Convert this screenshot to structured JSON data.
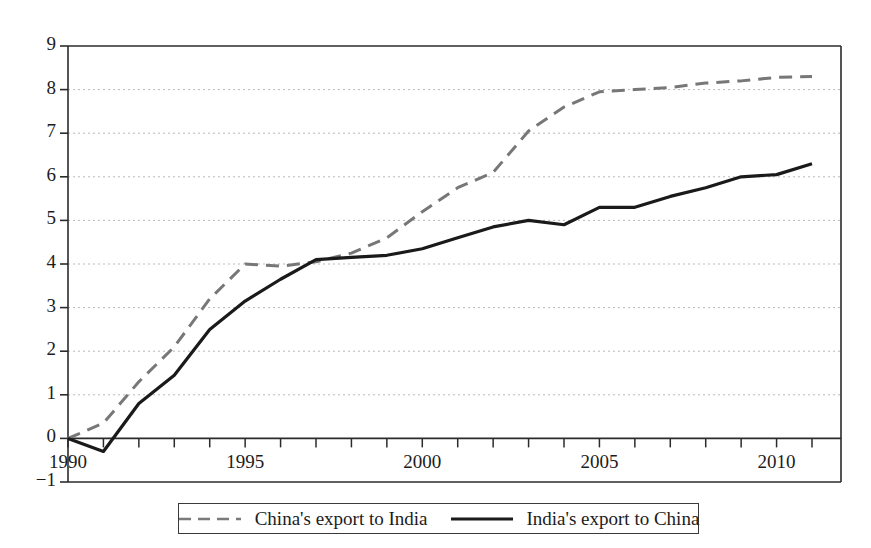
{
  "chart_data": {
    "type": "line",
    "title": "",
    "subtitle": "",
    "xlabel": "",
    "ylabel": "",
    "grid": true,
    "gridlines": "horizontal",
    "legend_position": "bottom",
    "xlim": [
      1990,
      2011
    ],
    "ylim": [
      -1,
      9
    ],
    "ytick_step": 1,
    "xtick_step": 1,
    "x": [
      1990,
      1991,
      1992,
      1993,
      1994,
      1995,
      1996,
      1997,
      1998,
      1999,
      2000,
      2001,
      2002,
      2003,
      2004,
      2005,
      2006,
      2007,
      2008,
      2009,
      2010,
      2011
    ],
    "x_tick_labels": [
      "1990",
      "",
      "",
      "",
      "",
      "1995",
      "",
      "",
      "",
      "",
      "2000",
      "",
      "",
      "",
      "",
      "2005",
      "",
      "",
      "",
      "",
      "2010",
      ""
    ],
    "y_tick_labels": [
      "-1",
      "0",
      "1",
      "2",
      "3",
      "4",
      "5",
      "6",
      "7",
      "8",
      "9"
    ],
    "series": [
      {
        "name": "China's export to India",
        "style": "dashed",
        "color": "#777777",
        "values": [
          0.0,
          0.35,
          1.3,
          2.1,
          3.2,
          4.0,
          3.95,
          4.05,
          4.25,
          4.6,
          5.2,
          5.75,
          6.1,
          7.05,
          7.6,
          7.95,
          8.0,
          8.05,
          8.15,
          8.2,
          8.28,
          8.3
        ]
      },
      {
        "name": "India's export to China",
        "style": "solid",
        "color": "#1a1a1a",
        "values": [
          0.0,
          -0.3,
          0.8,
          1.45,
          2.5,
          3.15,
          3.65,
          4.1,
          4.15,
          4.2,
          4.35,
          4.6,
          4.85,
          5.0,
          4.9,
          5.3,
          5.3,
          5.55,
          5.75,
          6.0,
          6.05,
          6.3
        ]
      }
    ]
  },
  "axes": {
    "y_ticks": [
      "9",
      "8",
      "7",
      "6",
      "5",
      "4",
      "3",
      "2",
      "1",
      "0",
      "-1"
    ],
    "x_ticks": [
      "1990",
      "1995",
      "2000",
      "2005",
      "2010"
    ]
  },
  "legend": {
    "entries": [
      {
        "label": "China's export to India",
        "style": "dashed"
      },
      {
        "label": "India's export to China",
        "style": "solid"
      }
    ]
  },
  "colors": {
    "dashed_series": "#787878",
    "solid_series": "#1a1a1a",
    "grid": "#b9b9b9",
    "axis": "#2b2b2b"
  }
}
